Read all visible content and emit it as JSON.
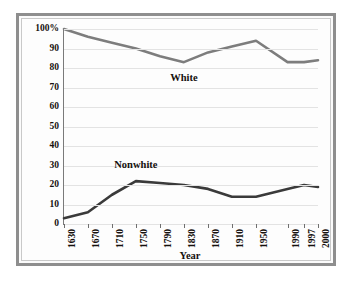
{
  "chart_data": {
    "type": "line",
    "title": "",
    "xlabel": "Year",
    "ylabel": "",
    "grid": true,
    "legend_position": "inline-labels",
    "categories": [
      "1630",
      "1670",
      "1710",
      "1750",
      "1790",
      "1830",
      "1870",
      "1910",
      "1950",
      "1990",
      "1997",
      "2000"
    ],
    "x_tick_labels": [
      "1630",
      "1670",
      "1710",
      "1750",
      "1790",
      "1830",
      "1870",
      "1910",
      "1950",
      "1990",
      "1997",
      "2000"
    ],
    "y_tick_labels": [
      "0",
      "10",
      "20",
      "30",
      "40",
      "50",
      "60",
      "70",
      "80",
      "90",
      "100%"
    ],
    "y_tick_values": [
      0,
      10,
      20,
      30,
      40,
      50,
      60,
      70,
      80,
      90,
      100
    ],
    "ylim": [
      0,
      100
    ],
    "series": [
      {
        "name": "White",
        "color": "#7d7d7d",
        "values": [
          100,
          96,
          93,
          90,
          86,
          83,
          88,
          91,
          94,
          83,
          83,
          84
        ]
      },
      {
        "name": "Nonwhite",
        "color": "#3a3a3a",
        "values": [
          3,
          6,
          15,
          22,
          21,
          20,
          18,
          14,
          14,
          18,
          20,
          19
        ]
      }
    ],
    "annotations": [
      {
        "text": "White",
        "series": "White"
      },
      {
        "text": "Nonwhite",
        "series": "Nonwhite"
      }
    ]
  },
  "axis": {
    "x_title": "Year"
  },
  "style": {
    "frame_color": "#8e8e8e",
    "grid_color": "#e3e3e3",
    "axis_color": "#7a7a7a",
    "background": "#fdfdfd",
    "text_color": "#16110e"
  }
}
